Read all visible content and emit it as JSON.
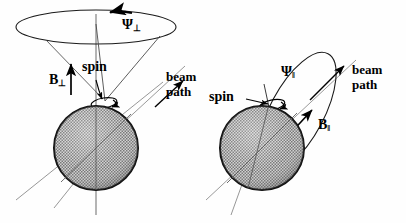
{
  "figure": {
    "type": "physics-schematic",
    "background_color": "#fefefe",
    "ink_color": "#000000",
    "sphere_fill": "#9a9a9a"
  },
  "panels": [
    {
      "id": "left",
      "name": "transverse-field-panel",
      "labels": {
        "psi": "Ψ",
        "psi_sub": "⊥",
        "field": "B",
        "field_sub": "⊥",
        "spin": "spin",
        "beam_line1": "beam",
        "beam_line2": "path"
      }
    },
    {
      "id": "right",
      "name": "longitudinal-field-panel",
      "labels": {
        "psi": "Ψ",
        "psi_sub": "‖",
        "field": "B",
        "field_sub": "‖",
        "spin": "spin",
        "beam_line1": "beam",
        "beam_line2": "path"
      }
    }
  ]
}
